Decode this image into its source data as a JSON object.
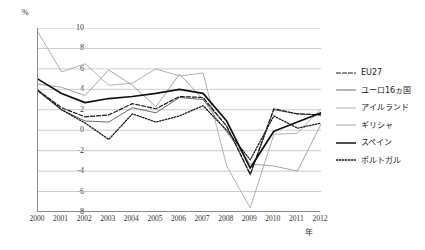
{
  "chart_data": {
    "type": "line",
    "title": "",
    "xlabel": "年",
    "ylabel": "%",
    "x": [
      2000,
      2001,
      2002,
      2003,
      2004,
      2005,
      2006,
      2007,
      2008,
      2009,
      2010,
      2011,
      2012
    ],
    "categories": [
      "2000",
      "2001",
      "2002",
      "2003",
      "2004",
      "2005",
      "2006",
      "2007",
      "2008",
      "2009",
      "2010",
      "2011",
      "2012"
    ],
    "ylim": [
      -8,
      10
    ],
    "yticks": [
      10,
      8,
      6,
      4,
      2,
      0,
      -2,
      -4,
      -6,
      -8
    ],
    "yticklabels": [
      "10",
      "8",
      "6",
      "4",
      "2",
      "0",
      "-2",
      "-4",
      "-6",
      "-8"
    ],
    "grid": true,
    "legend_position": "right",
    "series": [
      {
        "name": "EU27",
        "style": "dashed",
        "color": "#1a1a1a",
        "values": [
          3.9,
          2.2,
          1.3,
          1.5,
          2.6,
          2.1,
          3.3,
          3.2,
          0.4,
          -4.3,
          2.1,
          1.6,
          1.5
        ]
      },
      {
        "name": "ユーロ16ヵ国",
        "style": "solid-gray",
        "color": "#6b6b6b",
        "values": [
          3.8,
          2.0,
          0.9,
          0.8,
          2.2,
          1.7,
          3.2,
          3.0,
          0.4,
          -4.4,
          2.0,
          1.6,
          1.5
        ]
      },
      {
        "name": "アイルランド",
        "style": "solid-light",
        "color": "#a8a8a8",
        "values": [
          9.6,
          5.7,
          6.5,
          4.4,
          4.6,
          6.0,
          5.3,
          5.6,
          -3.5,
          -7.6,
          -0.4,
          -0.3,
          2.1
        ]
      },
      {
        "name": "ギリシャ",
        "style": "solid-midlight",
        "color": "#9a9a9a",
        "values": [
          4.5,
          4.2,
          3.4,
          5.9,
          4.4,
          2.3,
          5.5,
          3.0,
          -0.2,
          -3.3,
          -3.5,
          -4.0,
          0.6
        ]
      },
      {
        "name": "スペイン",
        "style": "solid-bold",
        "color": "#111111",
        "values": [
          5.0,
          3.6,
          2.7,
          3.1,
          3.3,
          3.6,
          4.0,
          3.6,
          0.9,
          -3.7,
          -0.1,
          0.8,
          1.7
        ]
      },
      {
        "name": "ポルトガル",
        "style": "dotted",
        "color": "#1a1a1a",
        "values": [
          3.9,
          2.0,
          0.7,
          -0.9,
          1.6,
          0.8,
          1.4,
          2.4,
          0.0,
          -2.9,
          1.4,
          0.2,
          0.7
        ]
      }
    ]
  },
  "legend": {
    "items": [
      {
        "label": "EU27",
        "swatch": "dashed-line-swatch"
      },
      {
        "label": "ユーロ16ヵ国",
        "swatch": "solid-gray-line-swatch"
      },
      {
        "label": "アイルランド",
        "swatch": "solid-light-line-swatch"
      },
      {
        "label": "ギリシャ",
        "swatch": "solid-midlight-line-swatch"
      },
      {
        "label": "スペイン",
        "swatch": "solid-bold-line-swatch"
      },
      {
        "label": "ポルトガル",
        "swatch": "dotted-line-swatch"
      }
    ]
  },
  "axes": {
    "y_unit": "%",
    "x_unit": "年"
  },
  "colors": {
    "axis": "#8a8a8a",
    "grid": "#bfbfbf",
    "text": "#222222"
  }
}
